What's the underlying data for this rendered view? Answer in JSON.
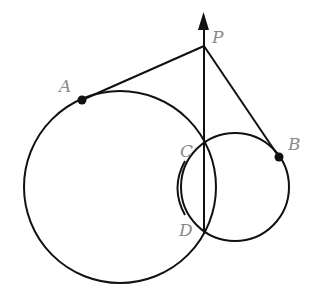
{
  "diagram": {
    "type": "geometry",
    "colors": {
      "stroke": "#111111",
      "label": "#8a8a8a",
      "background": "#ffffff"
    },
    "points": [
      {
        "id": "P",
        "label": "P",
        "x": 203,
        "y": 46
      },
      {
        "id": "A",
        "label": "A",
        "x": 82,
        "y": 100
      },
      {
        "id": "B",
        "label": "B",
        "x": 279,
        "y": 157
      },
      {
        "id": "C",
        "label": "C",
        "x": 204,
        "y": 142
      },
      {
        "id": "D",
        "label": "D",
        "x": 204,
        "y": 232
      }
    ],
    "circles": [
      {
        "id": "big-circle",
        "cx": 120,
        "cy": 187,
        "r": 96
      },
      {
        "id": "small-circle",
        "cx": 235,
        "cy": 187,
        "r": 54
      }
    ],
    "segments": [
      {
        "id": "PA",
        "from": "P",
        "to": "A"
      },
      {
        "id": "PB",
        "from": "P",
        "to": "B"
      }
    ],
    "ray": {
      "id": "ray-DP",
      "from": "D",
      "to": "arrow-tip",
      "tip_y": 14
    },
    "arc_marker": {
      "id": "chord-arc-CD",
      "description": "arc bracket marking chord CD"
    }
  }
}
